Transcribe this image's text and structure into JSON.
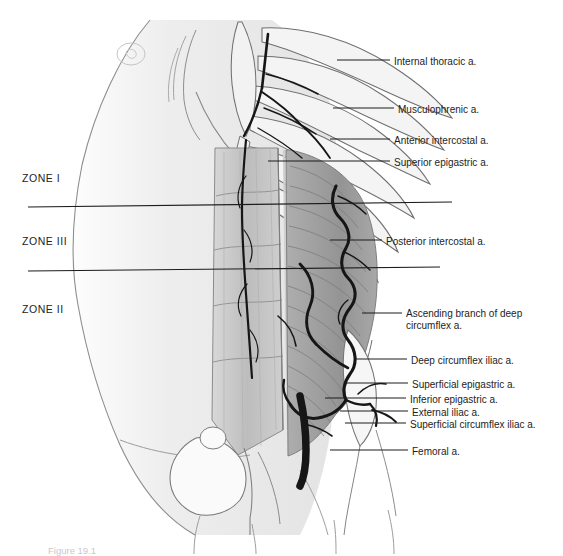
{
  "figure": {
    "caption": "Figure 19.1",
    "background_color": "#ffffff",
    "ink_color": "#1d1d1d",
    "muscle_gray": "#9a9a9a",
    "skin_gray": "#e8e8e8",
    "vessel_color": "#1a1a1a"
  },
  "zones": [
    {
      "label": "ZONE I",
      "x": 22,
      "y": 172
    },
    {
      "label": "ZONE III",
      "x": 22,
      "y": 235
    },
    {
      "label": "ZONE II",
      "x": 22,
      "y": 303
    }
  ],
  "dividers": [
    {
      "name": "zone-i-iii-divider",
      "x1": 28,
      "y1": 207,
      "x2": 452,
      "y2": 202
    },
    {
      "name": "zone-iii-ii-divider",
      "x1": 28,
      "y1": 271,
      "x2": 440,
      "y2": 267
    }
  ],
  "callouts": [
    {
      "name": "internal-thoracic",
      "label": "Internal thoracic a.",
      "text_x": 394,
      "text_y": 56,
      "lead_x1": 337,
      "lead_y1": 60,
      "lead_x2": 390,
      "lead_y2": 60
    },
    {
      "name": "musculophrenic",
      "label": "Musculophrenic a.",
      "text_x": 398,
      "text_y": 104,
      "lead_x1": 333,
      "lead_y1": 108,
      "lead_x2": 394,
      "lead_y2": 108
    },
    {
      "name": "anterior-intercostal",
      "label": "Anterior intercostal a.",
      "text_x": 394,
      "text_y": 135,
      "lead_x1": 330,
      "lead_y1": 139,
      "lead_x2": 390,
      "lead_y2": 139
    },
    {
      "name": "superior-epigastric",
      "label": "Superior epigastric a.",
      "text_x": 394,
      "text_y": 157,
      "lead_x1": 268,
      "lead_y1": 161,
      "lead_x2": 390,
      "lead_y2": 161
    },
    {
      "name": "posterior-intercostal",
      "label": "Posterior intercostal a.",
      "text_x": 386,
      "text_y": 236,
      "lead_x1": 330,
      "lead_y1": 240,
      "lead_x2": 382,
      "lead_y2": 240
    },
    {
      "name": "ascending-branch-deep-circumflex",
      "label": "Ascending branch of deep circumflex a.",
      "text_x": 406,
      "text_y": 308,
      "lead_x1": 362,
      "lead_y1": 313,
      "lead_x2": 402,
      "lead_y2": 313
    },
    {
      "name": "deep-circumflex-iliac",
      "label": "Deep circumflex iliac a.",
      "text_x": 411,
      "text_y": 355,
      "lead_x1": 355,
      "lead_y1": 359,
      "lead_x2": 407,
      "lead_y2": 359
    },
    {
      "name": "superficial-epigastric",
      "label": "Superficial epigastric a.",
      "text_x": 412,
      "text_y": 379,
      "lead_x1": 345,
      "lead_y1": 383,
      "lead_x2": 408,
      "lead_y2": 383
    },
    {
      "name": "inferior-epigastric",
      "label": "Inferior epigastric a.",
      "text_x": 410,
      "text_y": 394,
      "lead_x1": 325,
      "lead_y1": 398,
      "lead_x2": 406,
      "lead_y2": 398
    },
    {
      "name": "external-iliac",
      "label": "External iliac a.",
      "text_x": 412,
      "text_y": 407,
      "lead_x1": 340,
      "lead_y1": 411,
      "lead_x2": 408,
      "lead_y2": 411
    },
    {
      "name": "superficial-circumflex-iliac",
      "label": "Superficial circumflex iliac a.",
      "text_x": 410,
      "text_y": 419,
      "lead_x1": 345,
      "lead_y1": 423,
      "lead_x2": 406,
      "lead_y2": 423
    },
    {
      "name": "femoral",
      "label": "Femoral a.",
      "text_x": 412,
      "text_y": 446,
      "lead_x1": 330,
      "lead_y1": 450,
      "lead_x2": 408,
      "lead_y2": 450
    }
  ]
}
